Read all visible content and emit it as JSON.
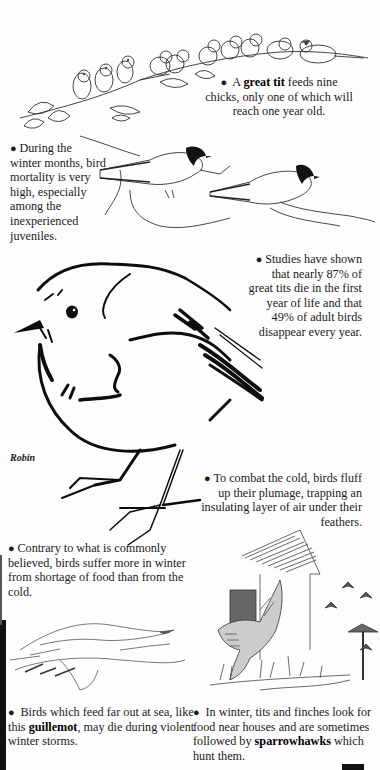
{
  "page": {
    "background": "#fdfdfd",
    "ink": "#1a1a1a"
  },
  "sections": [
    {
      "id": "great-tit-chicks",
      "illustration": "row of great tit chicks on a branch",
      "pre": "A ",
      "bold": "great tit",
      "post": " feeds nine chicks, only one of which will reach one year old."
    },
    {
      "id": "winter-mortality",
      "illustration": "two great tits on twigs",
      "text": "During the winter months, bird mortality is very high, especially among the inexperienced juveniles."
    },
    {
      "id": "studies",
      "text": "Studies have shown that nearly 87% of great tits die in the first year of life and that 49% of adult birds disappear every year."
    },
    {
      "id": "robin",
      "illustration": "fluffed-up robin",
      "caption": "Robin"
    },
    {
      "id": "combat-cold",
      "text": "To combat the cold, birds fluff up their plumage, trapping an insulating layer of air under their feathers."
    },
    {
      "id": "food-shortage",
      "text": "Contrary to what is commonly believed, birds suffer more in winter from shortage of food than from the cold."
    },
    {
      "id": "guillemot",
      "illustration": "guillemot lying dead on shore",
      "pre": "Birds which feed far out at sea, like this ",
      "bold": "guillemot",
      "post": ", may die during violent winter storms."
    },
    {
      "id": "sparrowhawk",
      "illustration": "sparrowhawk flying by a house with bird table and finches",
      "pre": "In winter, tits and finches look for food near houses and are sometimes followed by ",
      "bold": "sparrowhawks",
      "post": " which hunt them."
    }
  ]
}
